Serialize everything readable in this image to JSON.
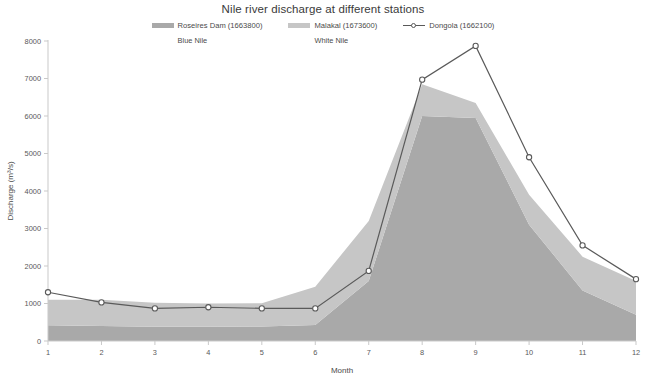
{
  "chart_data": {
    "type": "area",
    "title": "Nile river discharge at different stations",
    "xlabel": "Month",
    "ylabel": "Discharge (m³/s)",
    "categories": [
      "1",
      "2",
      "3",
      "4",
      "5",
      "6",
      "7",
      "8",
      "9",
      "10",
      "11",
      "12"
    ],
    "x": [
      1,
      2,
      3,
      4,
      5,
      6,
      7,
      8,
      9,
      10,
      11,
      12
    ],
    "xlim": [
      1,
      12
    ],
    "ylim": [
      0,
      8000
    ],
    "yticks": [
      0,
      1000,
      2000,
      3000,
      4000,
      5000,
      6000,
      7000,
      8000
    ],
    "grid": false,
    "legend_position": "top-center",
    "stacked": true,
    "series": [
      {
        "name": "Roseires Dam (1663800)",
        "sublabel": "Blue Nile",
        "render": "area-stacked",
        "color": "#a9a9a9",
        "values": [
          420,
          400,
          380,
          380,
          390,
          430,
          1600,
          6000,
          5950,
          3100,
          1350,
          700
        ]
      },
      {
        "name": "Malakal (1673600)",
        "sublabel": "White Nile",
        "render": "area-stacked",
        "color": "#c6c6c6",
        "values": [
          680,
          700,
          640,
          620,
          620,
          1020,
          1600,
          850,
          400,
          800,
          900,
          900
        ]
      },
      {
        "name": "Dongola (1662100)",
        "sublabel": "",
        "render": "line-marker",
        "color": "#5a5a5a",
        "values": [
          1300,
          1030,
          870,
          900,
          870,
          870,
          1870,
          6970,
          7870,
          4900,
          2550,
          1650
        ]
      }
    ]
  },
  "legend": {
    "items": [
      {
        "label": "Roseires Dam (1663800)",
        "sublabel": "Blue Nile",
        "marker": "swatch-icon"
      },
      {
        "label": "Malakal (1673600)",
        "sublabel": "White Nile",
        "marker": "swatch-icon"
      },
      {
        "label": "Dongola (1662100)",
        "sublabel": "",
        "marker": "line-marker-icon"
      }
    ]
  },
  "colors": {
    "roseires": "#a9a9a9",
    "malakal": "#c6c6c6",
    "dongola": "#5a5a5a",
    "axis": "#c9c9c9",
    "text": "#4a4a4a"
  }
}
